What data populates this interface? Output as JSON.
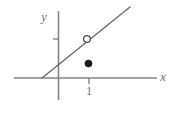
{
  "figure": {
    "width": 178,
    "height": 115,
    "background_color": "#ffffff",
    "axis_color": "#858585",
    "line_color": "#6e6e6e",
    "point_fill_color": "#1a1a1a",
    "point_hollow_fill_color": "#ffffff",
    "label_color": "#6b6b6b"
  },
  "axes": {
    "x_axis": {
      "label": "x",
      "label_x": 163,
      "label_y": 81,
      "x1": 14,
      "y1": 78,
      "x2": 157,
      "y2": 78
    },
    "y_axis": {
      "label": "y",
      "label_x": 44,
      "label_y": 21,
      "x1": 58.5,
      "y1": 11,
      "x2": 58.5,
      "y2": 100
    }
  },
  "ticks": [
    {
      "name": "x-axis-tick-1",
      "label": "1",
      "axis": "x",
      "x": 89,
      "y": 78,
      "x1": 89,
      "y1": 78,
      "x2": 89,
      "y2": 84,
      "label_x": 89,
      "label_y": 95
    },
    {
      "name": "y-axis-tick-unlabeled",
      "label": "",
      "axis": "y",
      "x": 58.5,
      "y": 39,
      "x1": 53,
      "y1": 39,
      "x2": 58.5,
      "y2": 39,
      "label_x": 0,
      "label_y": 0
    }
  ],
  "graph_line": {
    "name": "diagonal-line",
    "x1": 42,
    "y1": 78,
    "x2": 130,
    "y2": 7
  },
  "points": [
    {
      "name": "open-point",
      "type": "open",
      "cx": 87,
      "cy": 39,
      "r": 3.4
    },
    {
      "name": "closed-point",
      "type": "closed",
      "cx": 88.5,
      "cy": 63.5,
      "r": 3.6
    }
  ],
  "chart_data": {
    "type": "line",
    "title": "",
    "xlabel": "x",
    "ylabel": "y",
    "grid": false,
    "legend": null,
    "xlim": [
      -1.5,
      3.2
    ],
    "ylim": [
      -0.7,
      3.3
    ],
    "x_ticks": [
      1
    ],
    "x_tick_labels": [
      "1"
    ],
    "y_ticks": [
      1.3
    ],
    "y_tick_labels": [
      ""
    ],
    "series": [
      {
        "name": "line",
        "type": "line",
        "note": "straight line with a hole at x = 1",
        "x": [
          -0.55,
          2.35
        ],
        "y": [
          0,
          2.33
        ]
      }
    ],
    "annotations": [
      {
        "name": "open-point",
        "marker": "open-circle",
        "x": 1,
        "y": 1.28,
        "note": "removable discontinuity (value excluded)"
      },
      {
        "name": "closed-point",
        "marker": "filled-circle",
        "x": 1,
        "y": 0.48,
        "note": "actual function value at x = 1"
      }
    ]
  }
}
